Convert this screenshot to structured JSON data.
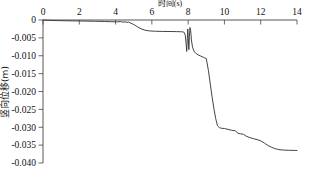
{
  "chart_data": {
    "type": "line",
    "title": "",
    "xlabel": "时间(s)",
    "ylabel": "竖向位移(m)",
    "xlim": [
      0,
      14
    ],
    "ylim": [
      -0.04,
      0
    ],
    "xticks": [
      0,
      2,
      4,
      6,
      8,
      10,
      12,
      14
    ],
    "xticklabels": [
      "0",
      "2",
      "4",
      "6",
      "8",
      "10",
      "12",
      "14"
    ],
    "yticks": [
      0,
      -0.005,
      -0.01,
      -0.015,
      -0.02,
      -0.025,
      -0.03,
      -0.035,
      -0.04
    ],
    "yticklabels": [
      "0",
      "-0.005",
      "-0.010",
      "-0.015",
      "-0.020",
      "-0.025",
      "-0.030",
      "-0.035",
      "-0.040"
    ],
    "x_axis_position": "top",
    "y_axis_position": "left",
    "y_axis_inverted": true,
    "grid": false,
    "legend": false,
    "line_color": "#3a3a3a",
    "series": [
      {
        "name": "竖向位移",
        "x": [
          0.0,
          0.35,
          0.9,
          1.6,
          2.3,
          2.9,
          3.4,
          3.8,
          4.1,
          4.28,
          4.4,
          4.52,
          4.62,
          4.72,
          4.8,
          4.92,
          5.05,
          5.2,
          5.4,
          5.62,
          5.85,
          6.2,
          6.6,
          7.0,
          7.35,
          7.58,
          7.7,
          7.78,
          7.84,
          7.88,
          7.92,
          7.95,
          7.98,
          8.01,
          8.04,
          8.07,
          8.1,
          8.14,
          8.18,
          8.24,
          8.32,
          8.42,
          8.55,
          8.7,
          8.85,
          9.0,
          9.12,
          9.22,
          9.32,
          9.42,
          9.52,
          9.62,
          9.72,
          9.85,
          10.0,
          10.2,
          10.4,
          10.6,
          10.75,
          10.9,
          11.05,
          11.2,
          11.4,
          11.6,
          11.8,
          12.0,
          12.2,
          12.4,
          12.6,
          12.8,
          13.0,
          13.3,
          13.6,
          13.9,
          14.0
        ],
        "y": [
          0.0,
          -0.0001,
          -0.00018,
          -0.00024,
          -0.0003,
          -0.00036,
          -0.00042,
          -0.00048,
          -0.00052,
          -0.00042,
          -0.00062,
          -0.0005,
          -0.00068,
          -0.00058,
          -0.0008,
          -0.00105,
          -0.0014,
          -0.0019,
          -0.00245,
          -0.00285,
          -0.00305,
          -0.00315,
          -0.0032,
          -0.00322,
          -0.00325,
          -0.00328,
          -0.00332,
          -0.00345,
          -0.0042,
          -0.0062,
          -0.0088,
          -0.0056,
          -0.0025,
          -0.0052,
          -0.0083,
          -0.0046,
          -0.0021,
          -0.003,
          -0.0056,
          -0.0076,
          -0.0087,
          -0.0093,
          -0.00975,
          -0.0101,
          -0.01045,
          -0.0108,
          -0.0142,
          -0.0179,
          -0.0215,
          -0.0248,
          -0.0276,
          -0.0296,
          -0.0301,
          -0.0303,
          -0.03035,
          -0.0306,
          -0.03085,
          -0.031,
          -0.0317,
          -0.03185,
          -0.03195,
          -0.0325,
          -0.0329,
          -0.0332,
          -0.03345,
          -0.0338,
          -0.0344,
          -0.0351,
          -0.0356,
          -0.036,
          -0.03625,
          -0.0364,
          -0.03645,
          -0.03648,
          -0.0365
        ]
      }
    ]
  }
}
